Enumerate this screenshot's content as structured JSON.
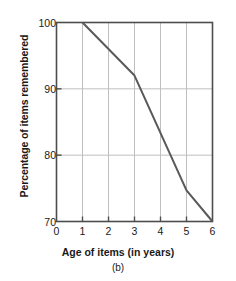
{
  "chart_data": {
    "type": "line",
    "title": "",
    "subcaption": "(b)",
    "xlabel": "Age of items (in years)",
    "ylabel": "Percentage of items remembered",
    "xlim": [
      0,
      6
    ],
    "ylim": [
      70,
      100
    ],
    "xticks": [
      0,
      1,
      2,
      3,
      4,
      5,
      6
    ],
    "yticks": [
      70,
      80,
      90,
      100
    ],
    "xtick_labels": [
      "0",
      "1",
      "2",
      "3",
      "4",
      "5",
      "6"
    ],
    "ytick_labels": [
      "70",
      "80",
      "90",
      "100"
    ],
    "grid": {
      "vertical": [
        1,
        2,
        3,
        4,
        5
      ],
      "horizontal": [
        80,
        90
      ],
      "color": "#bfbfbf"
    },
    "legend": null,
    "series": [
      {
        "name": "items remembered",
        "color": "#595959",
        "line_width": 2,
        "x": [
          1,
          3,
          5,
          6
        ],
        "values": [
          100,
          92,
          74.7,
          70
        ]
      }
    ],
    "axis_color": "#4d4d4d",
    "background": "#ffffff"
  }
}
